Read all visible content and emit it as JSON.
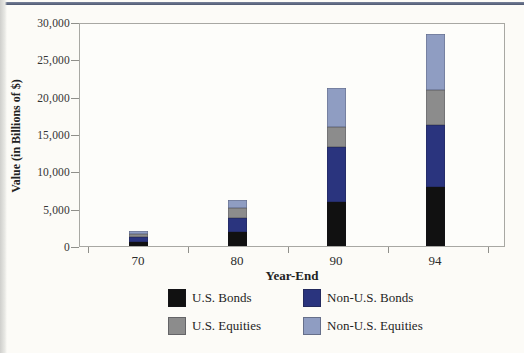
{
  "page": {
    "top_rule_color": "#5b6579",
    "background_color": "#fcfbf7"
  },
  "chart_data": {
    "type": "bar",
    "stacked": true,
    "title": "",
    "xlabel": "Year-End",
    "ylabel": "Value (in Billions of $)",
    "categories": [
      "70",
      "80",
      "90",
      "94"
    ],
    "series": [
      {
        "name": "U.S. Bonds",
        "color": "#111111",
        "values": [
          550,
          1900,
          5900,
          7900
        ]
      },
      {
        "name": "Non-U.S. Bonds",
        "color": "#2a347e",
        "values": [
          650,
          1900,
          7300,
          8300
        ]
      },
      {
        "name": "U.S. Equities",
        "color": "#8c8c8c",
        "values": [
          400,
          1300,
          2800,
          4700
        ]
      },
      {
        "name": "Non-U.S. Equities",
        "color": "#8f9dc2",
        "values": [
          450,
          1050,
          5200,
          7500
        ]
      }
    ],
    "totals": [
      2050,
      6150,
      21200,
      28400
    ],
    "ylim": [
      0,
      30000
    ],
    "yticks": [
      "0",
      "5,000",
      "10,000",
      "15,000",
      "20,000",
      "25,000",
      "30,000"
    ],
    "grid": false,
    "legend_position": "bottom",
    "legend_layout": "2x2"
  }
}
